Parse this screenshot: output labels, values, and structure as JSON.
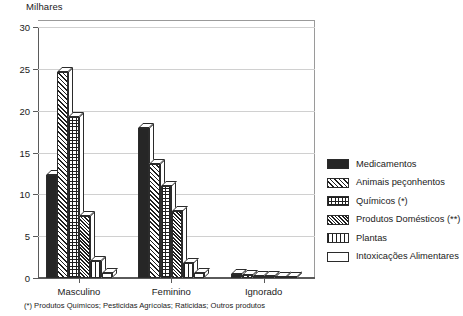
{
  "chart_data": {
    "type": "bar",
    "title": "",
    "unit_caption": "Milhares",
    "xlabel": "",
    "ylabel": "",
    "ylim": [
      0,
      30
    ],
    "ytick_values": [
      0,
      5,
      10,
      15,
      20,
      25,
      30
    ],
    "ytick_labels": [
      "0",
      "5",
      "10",
      "15",
      "20",
      "25",
      "30"
    ],
    "grid": true,
    "legend_position": "right",
    "style_3d": true,
    "categories": [
      "Masculino",
      "Feminino",
      "Ignorado"
    ],
    "series": [
      {
        "name": "Medicamentos",
        "pattern": "solid",
        "values": [
          12.3,
          17.9,
          0.5
        ]
      },
      {
        "name": "Animais peçonhentos",
        "pattern": "diagonal-hatch",
        "values": [
          24.6,
          13.6,
          0.4
        ]
      },
      {
        "name": "Químicos (*)",
        "pattern": "cross-grid",
        "values": [
          19.3,
          11.0,
          0.3
        ]
      },
      {
        "name": "Produtos Domésticos (**)",
        "pattern": "dense-diagonal",
        "values": [
          7.4,
          8.0,
          0.2
        ]
      },
      {
        "name": "Plantas",
        "pattern": "vertical-lines",
        "values": [
          2.0,
          1.8,
          0.1
        ]
      },
      {
        "name": "Intoxicações Alimentares",
        "pattern": "empty",
        "values": [
          0.6,
          0.6,
          0.05
        ]
      }
    ],
    "annotations": [
      "(*) Produtos Químicos; Pesticidas Agrícolas; Raticidas; Outros produtos"
    ]
  },
  "legend": {
    "items": [
      {
        "label": "Medicamentos"
      },
      {
        "label": "Animais peçonhentos"
      },
      {
        "label": "Químicos (*)"
      },
      {
        "label": "Produtos Domésticos (**)"
      },
      {
        "label": "Plantas"
      },
      {
        "label": "Intoxicações Alimentares"
      }
    ]
  },
  "footnote": {
    "text": "(*) Produtos Químicos; Pesticidas Agrícolas; Raticidas; Outros produtos"
  },
  "colors": {
    "axis": "#5a5a5a",
    "grid": "#d0d0d0",
    "ink": "#1f1f1f",
    "background": "#ffffff"
  }
}
